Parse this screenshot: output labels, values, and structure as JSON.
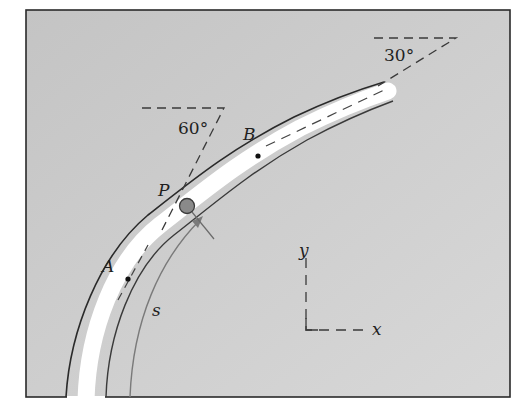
{
  "figure": {
    "colors": {
      "plate": "#c9c9c9",
      "track": "#ffffff",
      "edge": "#2a2a2a",
      "ball": "#8a8a8a",
      "dash": "#3a3a3a",
      "s_arc": "#7a7a7a"
    },
    "labels": {
      "point_A": "A",
      "point_B": "B",
      "particle": "P",
      "path_coord": "s",
      "angle_lower": "60°",
      "angle_upper": "30°",
      "axis_x": "x",
      "axis_y": "y"
    },
    "angles": {
      "tangent_at_A_deg": 60,
      "tangent_at_B_deg": 30
    }
  }
}
